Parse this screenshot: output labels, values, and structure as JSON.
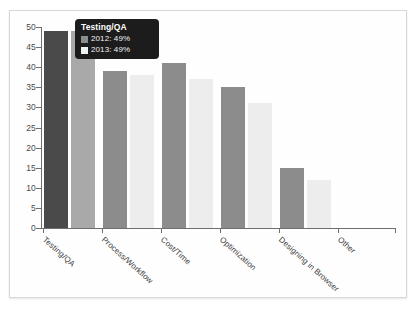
{
  "chart_data": {
    "type": "bar",
    "title": "",
    "xlabel": "",
    "ylabel": "",
    "ylim": [
      0,
      50
    ],
    "yticks": [
      0,
      5,
      10,
      15,
      20,
      25,
      30,
      35,
      40,
      45,
      50
    ],
    "grid": false,
    "legend_position": "tooltip",
    "categories": [
      "Testing/QA",
      "Process/Workflow",
      "Cost/Time",
      "Optimization",
      "Designing in Browser",
      "Other"
    ],
    "series": [
      {
        "name": "2012",
        "color": "#8c8c8c",
        "values": [
          49,
          39,
          41,
          35,
          15,
          0
        ]
      },
      {
        "name": "2013",
        "color": "#ededed",
        "values": [
          49,
          38,
          37,
          31,
          12,
          0
        ]
      }
    ],
    "bars": [
      {
        "category": "Testing/QA",
        "series": "2012",
        "value": 49,
        "color": "#4a4a4a",
        "highlighted": true
      },
      {
        "category": "Testing/QA",
        "series": "2013",
        "value": 49,
        "color": "#a9a9a9",
        "highlighted": true
      },
      {
        "category": "Process/Workflow",
        "series": "2012",
        "value": 39,
        "color": "#8c8c8c",
        "highlighted": false
      },
      {
        "category": "Process/Workflow",
        "series": "2013",
        "value": 38,
        "color": "#ededed",
        "highlighted": false
      },
      {
        "category": "Cost/Time",
        "series": "2012",
        "value": 41,
        "color": "#8c8c8c",
        "highlighted": false
      },
      {
        "category": "Cost/Time",
        "series": "2013",
        "value": 37,
        "color": "#ededed",
        "highlighted": false
      },
      {
        "category": "Optimization",
        "series": "2012",
        "value": 35,
        "color": "#8c8c8c",
        "highlighted": false
      },
      {
        "category": "Optimization",
        "series": "2013",
        "value": 31,
        "color": "#ededed",
        "highlighted": false
      },
      {
        "category": "Designing in Browser",
        "series": "2012",
        "value": 15,
        "color": "#8c8c8c",
        "highlighted": false
      },
      {
        "category": "Designing in Browser",
        "series": "2013",
        "value": 12,
        "color": "#ededed",
        "highlighted": false
      }
    ]
  },
  "tooltip": {
    "title": "Testing/QA",
    "rows": [
      {
        "label": "2012: 49%",
        "swatch": "#8c8c8c"
      },
      {
        "label": "2013: 49%",
        "swatch": "#f2f2f2"
      }
    ]
  },
  "axis": {
    "y_tick_labels": [
      "50",
      "45",
      "40",
      "35",
      "30",
      "25",
      "20",
      "15",
      "10",
      "5",
      "0"
    ],
    "x_tick_labels": [
      "Testing/QA",
      "Process/Workflow",
      "Cost/Time",
      "Optimization",
      "Designing in Browser",
      "Other"
    ]
  }
}
